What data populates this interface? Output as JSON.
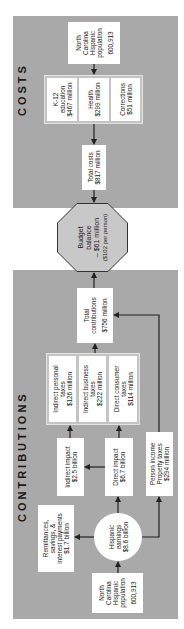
{
  "contributions": {
    "title": "CONTRIBUTIONS",
    "population": {
      "line1": "North",
      "line2": "Carolina",
      "line3": "Hispanic",
      "line4": "population",
      "value": "600,913"
    },
    "earnings": {
      "line1": "Hispanic",
      "line2": "earnings",
      "line3": "$8.6 billion"
    },
    "remittances": {
      "line1": "Remittances,",
      "line2": "savings, &",
      "line3": "interest payments",
      "line4": "$1.7 billion"
    },
    "indirect_impact": {
      "line1": "Indirect impact",
      "line2": "$2.5 billion"
    },
    "direct_impact": {
      "line1": "Direct impact",
      "line2": "$6.7 billion"
    },
    "person_income": {
      "line1": "Person income",
      "line2": "Property taxes",
      "line3": "$294 million"
    },
    "taxes": [
      {
        "line1": "Indirect personal",
        "line2": "taxes",
        "line3": "$126 million"
      },
      {
        "line1": "Indirect business",
        "line2": "taxes",
        "line3": "$222 million"
      },
      {
        "line1": "Direct consumer",
        "line2": "taxes",
        "line3": "$114 million"
      }
    ],
    "total": {
      "line1": "Total",
      "line2": "contributions",
      "value": "$756 million"
    }
  },
  "budget": {
    "line1": "Budget",
    "line2": "balance",
    "line3": "– $61 million",
    "line4": "($102 per person)"
  },
  "costs": {
    "title": "COSTS",
    "total": {
      "line1": "Total costs",
      "line2": "$817 million"
    },
    "items": [
      {
        "line1": "K-12",
        "line2": "education",
        "line3": "$467 million"
      },
      {
        "line1": "Health",
        "line2": "$299 million"
      },
      {
        "line1": "Corrections",
        "line2": "$51 million"
      }
    ],
    "population": {
      "line1": "North",
      "line2": "Carolina",
      "line3": "Hispanic",
      "line4": "population",
      "value": "600,913"
    }
  },
  "colors": {
    "panel": "#a9a9a9",
    "group": "#c4c4c4",
    "box": "#ffffff",
    "arrow": "#222222"
  }
}
